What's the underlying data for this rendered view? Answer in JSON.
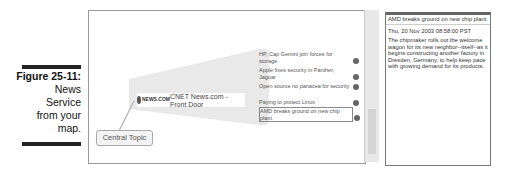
{
  "caption": {
    "figure": "Figure 25-11:",
    "lines": [
      "News",
      "Service",
      "from your",
      "map."
    ]
  },
  "map": {
    "central_topic": "Central Topic",
    "feed": {
      "logo": "NEWS.COM",
      "title": "CNET News.com - Front Door"
    },
    "subtopics": [
      {
        "label": "HP, Cap Gemini join forces for storage"
      },
      {
        "label": "Apple fixes security in Panther, Jaguar"
      },
      {
        "label": "Open source no panacea for security"
      },
      {
        "label": "Paying to protect Linux"
      },
      {
        "label": "AMD breaks ground on new chip plant",
        "selected": true
      }
    ]
  },
  "detail": {
    "title": "AMD breaks ground on new chip plant",
    "date": "Thu, 20 Nov 2003 08:58:00 PST",
    "body": "The chipmaker rolls out the welcome wagon for its new neighbor--itself--as it begins constructing another factory in Dresden, Germany, to help keep pace with growing demand for its products."
  }
}
